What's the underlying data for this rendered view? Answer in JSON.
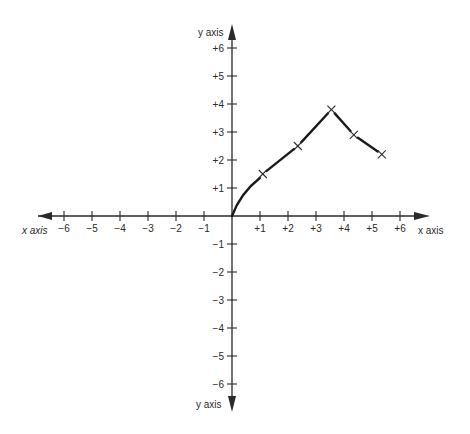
{
  "chart_data": {
    "type": "line",
    "title": "",
    "xlabel": "x axis",
    "ylabel": "y axis",
    "xlim": [
      -6,
      6
    ],
    "ylim": [
      -6,
      6
    ],
    "grid": false,
    "x_ticks": [
      "-6",
      "-5",
      "-4",
      "-3",
      "-2",
      "-1",
      "+1",
      "+2",
      "+3",
      "+4",
      "+5",
      "+6"
    ],
    "y_ticks": [
      "+6",
      "+5",
      "+4",
      "+3",
      "+2",
      "+1",
      "-1",
      "-2",
      "-3",
      "-4",
      "-5",
      "-6"
    ],
    "series": [
      {
        "name": "curve",
        "marker": "x",
        "x": [
          0,
          1.1,
          2.35,
          3.55,
          4.35,
          5.35
        ],
        "y": [
          0,
          1.5,
          2.5,
          3.8,
          2.9,
          2.2
        ]
      }
    ]
  },
  "labels": {
    "x_axis_left": "x axis",
    "x_axis_right": "x axis",
    "y_axis_top": "y axis",
    "y_axis_bottom": "y axis"
  },
  "colors": {
    "axis": "#2a2a2a",
    "line": "#1a1a1a",
    "background": "#ffffff"
  }
}
